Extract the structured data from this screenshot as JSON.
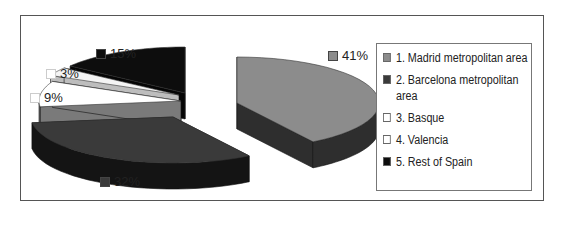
{
  "chart_data": {
    "type": "pie",
    "style": "3d-exploded",
    "title": "",
    "legend_position": "right",
    "categories": [
      "1. Madrid metropolitan area",
      "2. Barcelona metropolitan area",
      "3. Basque",
      "4. Valencia",
      "5. Rest of Spain"
    ],
    "values": [
      41,
      32,
      9,
      3,
      15
    ],
    "data_labels": [
      "41%",
      "32%",
      "9%",
      "3%",
      "15%"
    ],
    "colors": {
      "top": [
        "#8c8c8c",
        "#3a3a3a",
        "#ffffff",
        "#f4f4f4",
        "#0d0d0d"
      ],
      "side": [
        "#2e2e2e",
        "#141414",
        "#7a7a7a",
        "#bdbdbd",
        "#050505"
      ],
      "legend": [
        "#8c8c8c",
        "#3a3a3a",
        "#ffffff",
        "#ffffff",
        "#0d0d0d"
      ]
    }
  }
}
